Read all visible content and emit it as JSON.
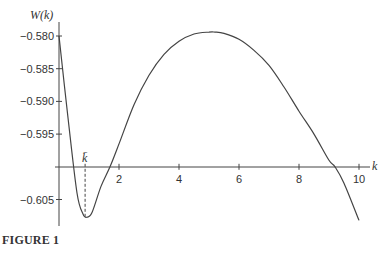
{
  "figure": {
    "caption": "FIGURE 1"
  },
  "chart_data": {
    "type": "line",
    "title": "",
    "xlabel": "k",
    "ylabel": "W(k)",
    "xlim": [
      0,
      10.5
    ],
    "ylim": [
      -0.6085,
      -0.579
    ],
    "x_axis_at_y": -0.6,
    "x_ticks": [
      2,
      4,
      6,
      8,
      10
    ],
    "x_tick_labels": [
      "2",
      "4",
      "6",
      "8",
      "10"
    ],
    "y_ticks": [
      -0.58,
      -0.585,
      -0.59,
      -0.595,
      -0.605
    ],
    "y_tick_labels": [
      "−0.580",
      "−0.585",
      "−0.590",
      "−0.595",
      "−0.605"
    ],
    "grid": false,
    "legend": null,
    "annotations": [
      {
        "type": "dashed-vline",
        "x": 0.87,
        "label": "k̄",
        "note": "k-bar marks the minimum"
      }
    ],
    "series": [
      {
        "name": "W(k)",
        "x": [
          0.0,
          0.3,
          0.6,
          0.8,
          0.93,
          1.1,
          1.4,
          1.7,
          2.0,
          2.5,
          3.0,
          3.5,
          4.0,
          4.5,
          5.0,
          5.2,
          5.5,
          6.0,
          6.5,
          7.0,
          7.5,
          8.0,
          8.5,
          9.0,
          9.2,
          9.5,
          10.0
        ],
        "y": [
          -0.58,
          -0.5925,
          -0.604,
          -0.6072,
          -0.6077,
          -0.607,
          -0.603,
          -0.6,
          -0.5965,
          -0.5905,
          -0.586,
          -0.5828,
          -0.5808,
          -0.5797,
          -0.5794,
          -0.5794,
          -0.5796,
          -0.5805,
          -0.5822,
          -0.5845,
          -0.5878,
          -0.5915,
          -0.595,
          -0.599,
          -0.6,
          -0.6025,
          -0.6082
        ]
      }
    ]
  }
}
